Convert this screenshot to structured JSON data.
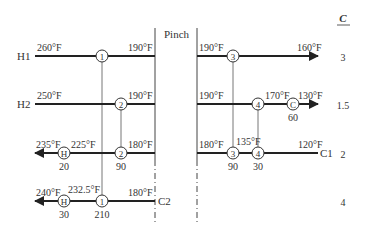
{
  "pinch_label": "Pinch",
  "c_header": "C",
  "streams": {
    "H1": {
      "label": "H1",
      "t_in": "260°F",
      "t_pinch_left": "190°F",
      "t_pinch_right": "190°F",
      "t_out": "160°F",
      "c": "3"
    },
    "H2": {
      "label": "H2",
      "t_in": "250°F",
      "t_pinch_left": "190°F",
      "t_pinch_right": "190°F",
      "t_mid": "170°F",
      "t_out": "130°F",
      "c": "1.5"
    },
    "C1": {
      "label": "C1",
      "t_in": "120°F",
      "t_mid": "135°F",
      "t_pinch_right": "180°F",
      "t_pinch_left": "180°F",
      "t_mid_left": "225°F",
      "t_out": "235°F",
      "c": "2"
    },
    "C2": {
      "label": "C2",
      "t_in": "180°F",
      "t_mid": "232.5°F",
      "t_out": "240°F",
      "c": "4"
    }
  },
  "exchangers": {
    "e1": {
      "id": "1",
      "duty": "210"
    },
    "e2": {
      "id": "2",
      "duty": "90"
    },
    "e3": {
      "id": "3",
      "duty": "90"
    },
    "e4": {
      "id": "4",
      "duty": "30"
    },
    "cooler": {
      "id": "C",
      "duty": "60"
    },
    "heater_c1": {
      "id": "H",
      "duty": "20"
    },
    "heater_c2": {
      "id": "H",
      "duty": "30"
    }
  },
  "colors": {
    "stream": "#222222",
    "link": "#555555",
    "text": "#333333"
  }
}
